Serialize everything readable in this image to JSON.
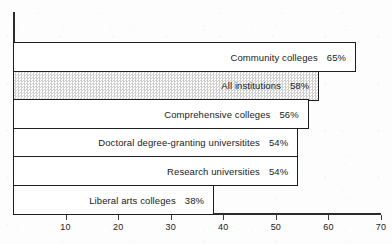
{
  "chart_data": {
    "type": "bar",
    "orientation": "horizontal",
    "title": "",
    "xlabel": "",
    "ylabel": "",
    "xlim": [
      0,
      70
    ],
    "xticks": [
      10,
      20,
      30,
      40,
      50,
      60,
      70
    ],
    "xtick_labels": [
      "10",
      "20",
      "30",
      "40",
      "50",
      "60",
      "70"
    ],
    "grid": false,
    "legend": null,
    "value_suffix": "%",
    "categories": [
      "Community colleges",
      "All institutions",
      "Comprehensive colleges",
      "Doctoral degree-granting universitites",
      "Research universities",
      "Liberal arts colleges"
    ],
    "values": [
      65,
      58,
      56,
      54,
      54,
      38
    ],
    "bars": [
      {
        "label": "Community colleges",
        "value": 65,
        "value_label": "65%",
        "fill": "white"
      },
      {
        "label": "All institutions",
        "value": 58,
        "value_label": "58%",
        "fill": "screened"
      },
      {
        "label": "Comprehensive colleges",
        "value": 56,
        "value_label": "56%",
        "fill": "white"
      },
      {
        "label": "Doctoral degree-granting universitites",
        "value": 54,
        "value_label": "54%",
        "fill": "white"
      },
      {
        "label": "Research universities",
        "value": 54,
        "value_label": "54%",
        "fill": "white"
      },
      {
        "label": "Liberal arts colleges",
        "value": 38,
        "value_label": "38%",
        "fill": "white"
      }
    ]
  },
  "colors": {
    "ink": "#1d1d1d",
    "axis": "#2b2b2b",
    "paper": "#fdfdfd",
    "screen_fill": "#cfcfcf"
  }
}
